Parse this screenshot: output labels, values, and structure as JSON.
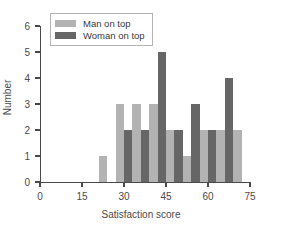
{
  "chart_data": {
    "type": "bar",
    "title": "",
    "subtitle": "",
    "xlabel": "Satisfaction score",
    "ylabel": "Number",
    "xlim": [
      0,
      75
    ],
    "ylim": [
      0,
      6
    ],
    "xticks": [
      0,
      15,
      30,
      45,
      60,
      75
    ],
    "yticks": [
      0,
      1,
      2,
      3,
      4,
      5,
      6
    ],
    "grid": false,
    "legend_position": "top-left",
    "bin_width": 3,
    "series": [
      {
        "name": "Man on top",
        "color": "#b3b3b3",
        "bins": [
          21,
          27,
          33,
          39,
          45,
          51,
          57
        ],
        "values": [
          1,
          3,
          3,
          2,
          1,
          2,
          2
        ]
      },
      {
        "name": "Woman on top",
        "color": "#666666",
        "bins": [
          30,
          36,
          42,
          48,
          54,
          60
        ],
        "values": [
          2,
          2,
          5,
          3,
          2,
          4
        ]
      }
    ],
    "bars": [
      {
        "x": 21,
        "height": 1,
        "series": "Man on top"
      },
      {
        "x": 27,
        "height": 3,
        "series": "Man on top"
      },
      {
        "x": 30,
        "height": 2,
        "series": "Woman on top"
      },
      {
        "x": 33,
        "height": 3,
        "series": "Man on top"
      },
      {
        "x": 36,
        "height": 2,
        "series": "Woman on top"
      },
      {
        "x": 39,
        "height": 3,
        "series": "Man on top"
      },
      {
        "x": 42,
        "height": 5,
        "series": "Woman on top"
      },
      {
        "x": 45,
        "height": 2,
        "series": "Man on top"
      },
      {
        "x": 48,
        "height": 2,
        "series": "Woman on top"
      },
      {
        "x": 51,
        "height": 1,
        "series": "Man on top"
      },
      {
        "x": 54,
        "height": 3,
        "series": "Woman on top"
      },
      {
        "x": 57,
        "height": 2,
        "series": "Man on top"
      },
      {
        "x": 60,
        "height": 2,
        "series": "Woman on top"
      },
      {
        "x": 63,
        "height": 2,
        "series": "Man on top"
      },
      {
        "x": 66,
        "height": 4,
        "series": "Woman on top"
      },
      {
        "x": 69,
        "height": 2,
        "series": "Man on top"
      }
    ]
  },
  "axes": {
    "y_tick_labels": [
      "0",
      "1",
      "2",
      "3",
      "4",
      "5",
      "6"
    ],
    "x_tick_labels": [
      "0",
      "15",
      "30",
      "45",
      "60",
      "75"
    ],
    "x_title": "Satisfaction score",
    "y_title": "Number"
  },
  "legend": {
    "entries": [
      {
        "label": "Man on top",
        "color": "#b3b3b3"
      },
      {
        "label": "Woman on top",
        "color": "#666666"
      }
    ]
  },
  "colors": {
    "light_gray": "#b3b3b3",
    "dark_gray": "#666666",
    "axis": "#4a4a4a",
    "background": "#ffffff"
  }
}
